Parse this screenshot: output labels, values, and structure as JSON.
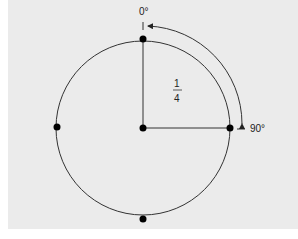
{
  "diagram": {
    "labels": {
      "start_angle": "0°",
      "end_angle": "90°",
      "fraction_numerator": "1",
      "fraction_denominator": "4"
    },
    "circle": {
      "center": [
        143,
        128
      ],
      "radius": 87
    },
    "points": [
      "top",
      "right",
      "bottom",
      "left",
      "center"
    ],
    "colors": {
      "background": "#ebebeb",
      "stroke": "#222222",
      "dot": "#000000"
    }
  }
}
